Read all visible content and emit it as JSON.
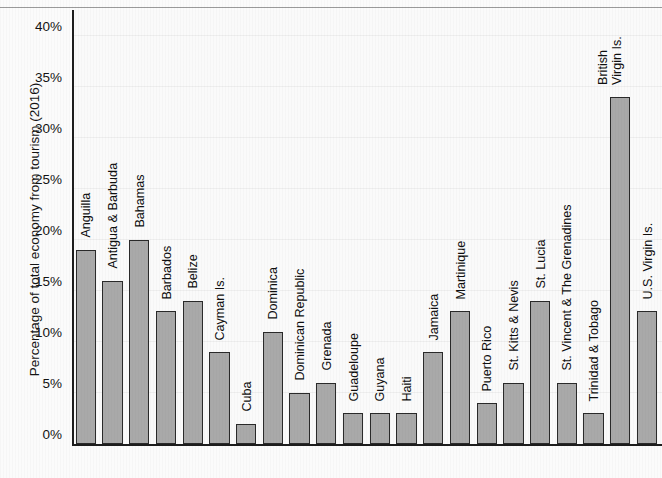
{
  "figure": {
    "title": "GDP SHARE OF TOURISM",
    "title_note": "truncated-at-top-of-image"
  },
  "axes": {
    "ylabel": "Percentage of total economy from tourism (2016)",
    "xlabel": "",
    "yticks": [
      "0%",
      "5%",
      "10%",
      "15%",
      "20%",
      "25%",
      "30%",
      "35%",
      "40%"
    ],
    "ylim": [
      0,
      42.5
    ]
  },
  "style": {
    "bar_fill": "#a9a9a9",
    "bar_edge": "#2a2a2a",
    "plot_bg": "#fafafa",
    "axis_color": "#1d1d1d",
    "grid_color": "#eeeeee"
  },
  "chart_data": {
    "type": "bar",
    "title": "GDP SHARE OF TOURISM",
    "xlabel": "",
    "ylabel": "Percentage of total economy from tourism (2016)",
    "ylim": [
      0,
      42.5
    ],
    "ytick_values": [
      0,
      5,
      10,
      15,
      20,
      25,
      30,
      35,
      40
    ],
    "ytick_labels": [
      "0%",
      "5%",
      "10%",
      "15%",
      "20%",
      "25%",
      "30%",
      "35%",
      "40%"
    ],
    "grid": true,
    "legend": null,
    "categories": [
      "Anguilla",
      "Antigua & Barbuda",
      "Bahamas",
      "Barbados",
      "Belize",
      "Cayman Is.",
      "Cuba",
      "Dominica",
      "Dominican Republic",
      "Grenada",
      "Guadeloupe",
      "Guyana",
      "Haiti",
      "Jamaica",
      "Martinique",
      "Puerto Rico",
      "St. Kitts & Nevis",
      "St. Lucia",
      "St. Vincent & The Grenadines",
      "Trinidad & Tobago",
      "British Virgin Is.",
      "U.S. Virgin Is."
    ],
    "values": [
      19,
      16,
      20,
      13,
      14,
      9,
      2,
      11,
      5,
      6,
      3,
      3,
      3,
      9,
      13,
      4,
      6,
      14,
      6,
      3,
      34,
      13
    ]
  }
}
